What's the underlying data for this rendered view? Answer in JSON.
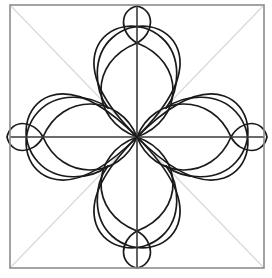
{
  "figure": {
    "canvas": {
      "width": 272,
      "height": 278,
      "background": "#ffffff"
    }
  },
  "colors": {
    "background": "#ffffff",
    "frame_stroke": "#8c8c8c",
    "diagonal_stroke": "#d9d9d9",
    "axis_stroke": "#3a3a3a",
    "petal_stroke": "#1a1a1a",
    "petal_fill": "none"
  },
  "geometry": {
    "center": {
      "x": 137,
      "y": 137
    },
    "frame": {
      "x": 10,
      "y": 5,
      "width": 254,
      "height": 263,
      "stroke_width": 1.6
    },
    "axis_stroke_width": 1.6,
    "diagonal_stroke_width": 1.2,
    "petal_stroke_width": 1.7,
    "node_radius_axis": 95,
    "small_petal_outer": 127,
    "large_petal_axis_tip": 220,
    "diagonal_lobe_radius": 62
  },
  "elements": {
    "frame_label": "square-frame",
    "diagonals_label": "corner-diagonals",
    "axes_label": "center-cross-axes",
    "axis_petals_label": "axis-petals",
    "diagonal_lobes_label": "diagonal-heart-lobes",
    "small_petals_label": "small-tip-petals",
    "center_label": "center-node"
  },
  "counts": {
    "axis_petals": 4,
    "diagonal_lobes": 4,
    "small_petals": 4,
    "diagonals": 2,
    "axes": 2
  }
}
